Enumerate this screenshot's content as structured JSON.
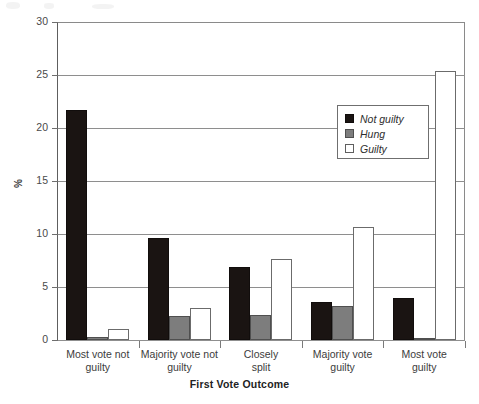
{
  "chart_data": {
    "type": "bar",
    "title": "",
    "subtitle": "",
    "xlabel": "First Vote Outcome",
    "ylabel": "%",
    "categories": [
      "Most vote not guilty",
      "Majority vote not guilty",
      "Closely split",
      "Majority vote guilty",
      "Most vote guilty"
    ],
    "category_lines": [
      [
        "Most vote not",
        "guilty"
      ],
      [
        "Majority vote not",
        "guilty"
      ],
      [
        "Closely",
        "split"
      ],
      [
        "Majority vote",
        "guilty"
      ],
      [
        "Most vote",
        "guilty"
      ]
    ],
    "series": [
      {
        "name": "Not guilty",
        "color": "#1a1412",
        "values": [
          21.7,
          9.6,
          6.9,
          3.6,
          4.0
        ]
      },
      {
        "name": "Hung",
        "color": "#7d7d7d",
        "values": [
          0.3,
          2.3,
          2.4,
          3.2,
          0.2
        ]
      },
      {
        "name": "Guilty",
        "color": "#ffffff",
        "values": [
          1.0,
          3.0,
          7.6,
          10.7,
          25.4
        ]
      }
    ],
    "ylim": [
      0,
      30
    ],
    "yticks": [
      0,
      5,
      10,
      15,
      20,
      25,
      30
    ],
    "ytick_labels": [
      "0",
      "5",
      "10",
      "15",
      "20",
      "25",
      "30"
    ],
    "grid": "horizontal",
    "legend_position": "upper-right",
    "legend_entries": [
      "Not guilty",
      "Hung",
      "Guilty"
    ]
  }
}
